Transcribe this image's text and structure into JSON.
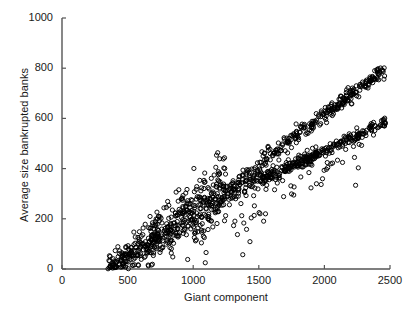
{
  "chart_data": {
    "type": "scatter",
    "title": "",
    "xlabel": "Giant component",
    "ylabel": "Average size bankrupted banks",
    "xlim": [
      0,
      2500
    ],
    "ylim": [
      0,
      1000
    ],
    "xticks": [
      0,
      500,
      1000,
      1500,
      2000,
      2500
    ],
    "yticks": [
      0,
      200,
      400,
      600,
      800,
      1000
    ],
    "xtick_labels": [
      "0",
      "500",
      "1000",
      "1500",
      "2000",
      "2500"
    ],
    "ytick_labels": [
      "0",
      "200",
      "400",
      "600",
      "800",
      "1000"
    ],
    "grid": false,
    "legend": null,
    "marker": "open-circle",
    "marker_size_px": 4.2,
    "marker_color": "#000000",
    "marker_fill": "none",
    "n_points_approx": 1150,
    "series": [
      {
        "name": "main-cloud",
        "x_range": [
          350,
          1250
        ],
        "y_range": [
          0,
          420
        ],
        "n": 520,
        "slope": 0.36,
        "intercept": -128,
        "scatter_y": 55,
        "comment": "broad rising cloud before the branch split"
      },
      {
        "name": "upper-branch",
        "x_range": [
          1200,
          2470
        ],
        "y_range": [
          300,
          810
        ],
        "n": 300,
        "slope": 0.395,
        "intercept": -175,
        "scatter_y": 16,
        "comment": "steepest branch, reaches about 800 at x = 2450"
      },
      {
        "name": "middle-branch",
        "x_range": [
          1200,
          2470
        ],
        "y_range": [
          280,
          590
        ],
        "n": 250,
        "slope": 0.245,
        "intercept": -20,
        "scatter_y": 14,
        "comment": "middle branch, reaches about 580 at x = 2450"
      },
      {
        "name": "lower-branch",
        "x_range": [
          1200,
          1950
        ],
        "y_range": [
          280,
          460
        ],
        "n": 120,
        "slope": 0.225,
        "intercept": 20,
        "scatter_y": 13,
        "comment": "shortest branch, ends near x = 1900, y = 450"
      },
      {
        "name": "outliers",
        "x_range": [
          950,
          2300
        ],
        "y_range": [
          90,
          520
        ],
        "n": 60,
        "scatter_y": 90,
        "comment": "sparse isolated points below the branches"
      }
    ]
  },
  "axes": {
    "x_axis_name": "Giant component",
    "y_axis_name": "Average size bankrupted banks"
  }
}
